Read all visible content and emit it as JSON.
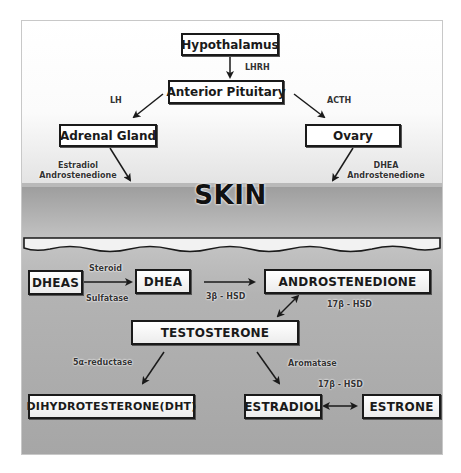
{
  "diagram": {
    "title": "SKIN",
    "colors": {
      "box_border": "#1a1a1a",
      "box_fill": "#ffffff",
      "skin_background": "#b3b3b3",
      "top_background": "#ffffff"
    },
    "nodes": {
      "hypothalamus": "Hypothalamus",
      "anterior_pituitary": "Anterior Pituitary",
      "adrenal_gland": "Adrenal Gland",
      "ovary": "Ovary",
      "dheas": "DHEAS",
      "dhea": "DHEA",
      "androstenedione": "ANDROSTENEDIONE",
      "testosterone": "TESTOSTERONE",
      "dht": "DIHYDROTESTERONE(DHT)",
      "estradiol": "ESTRADIOL",
      "estrone": "ESTRONE"
    },
    "labels": {
      "lhrh": "LHRH",
      "lh": "LH",
      "acth": "ACTH",
      "adrenal_out_1": "Estradiol",
      "adrenal_out_2": "Androstenedione",
      "ovary_out_1": "DHEA",
      "ovary_out_2": "Androstenedione",
      "steroid": "Steroid",
      "sulfatase": "Sulfatase",
      "hsd3b": "3β - HSD",
      "hsd17b_top": "17β - HSD",
      "reductase": "5α-reductase",
      "aromatase": "Aromatase",
      "hsd17b_bottom": "17β - HSD"
    },
    "edges": [
      {
        "from": "Hypothalamus",
        "to": "Anterior Pituitary",
        "label": "LHRH"
      },
      {
        "from": "Anterior Pituitary",
        "to": "Adrenal Gland",
        "label": "LH"
      },
      {
        "from": "Anterior Pituitary",
        "to": "Ovary",
        "label": "ACTH"
      },
      {
        "from": "Adrenal Gland",
        "to": "SKIN",
        "label": "Estradiol Androstenedione"
      },
      {
        "from": "Ovary",
        "to": "SKIN",
        "label": "DHEA Androstenedione"
      },
      {
        "from": "DHEAS",
        "to": "DHEA",
        "label": "Steroid Sulfatase"
      },
      {
        "from": "DHEA",
        "to": "ANDROSTENEDIONE",
        "label": "3β - HSD"
      },
      {
        "from": "ANDROSTENEDIONE",
        "to": "TESTOSTERONE",
        "label": "17β - HSD",
        "bidirectional": true
      },
      {
        "from": "TESTOSTERONE",
        "to": "DIHYDROTESTERONE(DHT)",
        "label": "5α-reductase"
      },
      {
        "from": "TESTOSTERONE",
        "to": "ESTRADIOL",
        "label": "Aromatase"
      },
      {
        "from": "ESTRADIOL",
        "to": "ESTRONE",
        "label": "17β - HSD",
        "bidirectional": true
      }
    ]
  }
}
